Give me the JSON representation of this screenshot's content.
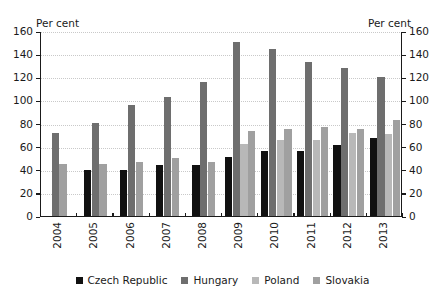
{
  "chart_data": {
    "type": "bar",
    "title": "",
    "subtitle": "",
    "xlabel": "",
    "ylabel": "Per cent",
    "y2label": "Per cent",
    "unit_left": "Per cent",
    "unit_right": "Per cent",
    "ylim": [
      0,
      160
    ],
    "ytick_step": 20,
    "yticks": [
      0,
      20,
      40,
      60,
      80,
      100,
      120,
      140,
      160
    ],
    "ytick_labels": [
      "0",
      "20",
      "40",
      "60",
      "80",
      "100",
      "120",
      "140",
      "160"
    ],
    "grid": true,
    "grid_axis": "y",
    "legend_position": "bottom",
    "categories": [
      "2004",
      "2005",
      "2006",
      "2007",
      "2008",
      "2009",
      "2010",
      "2011",
      "2012",
      "2013"
    ],
    "series": [
      {
        "name": "Czech Republic",
        "color": "#111111",
        "values": [
          null,
          41,
          41,
          45,
          45,
          52,
          57,
          57,
          62,
          68
        ]
      },
      {
        "name": "Hungary",
        "color": "#6e6e6e",
        "values": [
          73,
          81,
          97,
          104,
          117,
          151,
          145,
          134,
          129,
          121
        ]
      },
      {
        "name": "Poland",
        "color": "#b8b8b8",
        "values": [
          null,
          null,
          null,
          null,
          null,
          63,
          67,
          67,
          73,
          72
        ]
      },
      {
        "name": "Slovakia",
        "color": "#a0a0a0",
        "values": [
          46,
          46,
          48,
          51,
          48,
          74,
          76,
          78,
          76,
          84
        ]
      }
    ]
  },
  "legend": {
    "items": [
      {
        "label": "Czech Republic",
        "color": "#111111"
      },
      {
        "label": "Hungary",
        "color": "#6e6e6e"
      },
      {
        "label": "Poland",
        "color": "#b8b8b8"
      },
      {
        "label": "Slovakia",
        "color": "#a0a0a0"
      }
    ]
  }
}
